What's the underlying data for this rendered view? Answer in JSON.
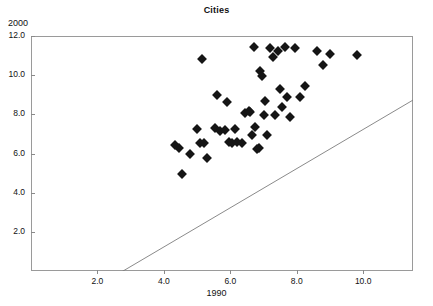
{
  "chart_data": {
    "type": "scatter",
    "title": "Cities",
    "xlabel": "1990",
    "ylabel": "2000",
    "xlim": [
      0,
      11.5
    ],
    "ylim": [
      0,
      12.0
    ],
    "grid": false,
    "legend": null,
    "xticks": [
      "2.0",
      "4.0",
      "6.0",
      "8.0",
      "10.0"
    ],
    "xtick_values": [
      2.0,
      4.0,
      6.0,
      8.0,
      10.0
    ],
    "yticks": [
      "2.0",
      "4.0",
      "6.0",
      "8.0",
      "10.0",
      "12.0"
    ],
    "ytick_values": [
      2.0,
      4.0,
      6.0,
      8.0,
      10.0,
      12.0
    ],
    "marker": "filled-diamond",
    "marker_color": "#151515",
    "reference_line": {
      "name": "y = x identity line",
      "x0": 0.0,
      "y0": 0.0,
      "x1": 11.5,
      "y1": 11.5,
      "color": "#7d7d7d"
    },
    "points": [
      {
        "x": 4.35,
        "y": 6.45
      },
      {
        "x": 4.45,
        "y": 6.3
      },
      {
        "x": 4.55,
        "y": 4.95
      },
      {
        "x": 4.8,
        "y": 6.0
      },
      {
        "x": 5.0,
        "y": 7.25
      },
      {
        "x": 5.1,
        "y": 6.55
      },
      {
        "x": 5.15,
        "y": 10.85
      },
      {
        "x": 5.2,
        "y": 6.55
      },
      {
        "x": 5.3,
        "y": 5.75
      },
      {
        "x": 5.55,
        "y": 7.3
      },
      {
        "x": 5.6,
        "y": 9.0
      },
      {
        "x": 5.7,
        "y": 7.15
      },
      {
        "x": 5.85,
        "y": 7.2
      },
      {
        "x": 5.9,
        "y": 8.65
      },
      {
        "x": 5.95,
        "y": 6.6
      },
      {
        "x": 6.05,
        "y": 6.55
      },
      {
        "x": 6.15,
        "y": 7.25
      },
      {
        "x": 6.2,
        "y": 6.6
      },
      {
        "x": 6.35,
        "y": 6.55
      },
      {
        "x": 6.45,
        "y": 8.05
      },
      {
        "x": 6.55,
        "y": 8.15
      },
      {
        "x": 6.6,
        "y": 8.1
      },
      {
        "x": 6.65,
        "y": 6.95
      },
      {
        "x": 6.7,
        "y": 11.45
      },
      {
        "x": 6.75,
        "y": 7.35
      },
      {
        "x": 6.8,
        "y": 6.25
      },
      {
        "x": 6.85,
        "y": 6.3
      },
      {
        "x": 6.9,
        "y": 10.2
      },
      {
        "x": 6.95,
        "y": 9.95
      },
      {
        "x": 7.0,
        "y": 7.95
      },
      {
        "x": 7.05,
        "y": 8.7
      },
      {
        "x": 7.1,
        "y": 6.95
      },
      {
        "x": 7.2,
        "y": 11.4
      },
      {
        "x": 7.3,
        "y": 10.95
      },
      {
        "x": 7.35,
        "y": 7.95
      },
      {
        "x": 7.45,
        "y": 11.25
      },
      {
        "x": 7.5,
        "y": 9.3
      },
      {
        "x": 7.55,
        "y": 8.35
      },
      {
        "x": 7.65,
        "y": 11.45
      },
      {
        "x": 7.7,
        "y": 8.9
      },
      {
        "x": 7.8,
        "y": 7.85
      },
      {
        "x": 7.95,
        "y": 11.4
      },
      {
        "x": 8.1,
        "y": 8.9
      },
      {
        "x": 8.25,
        "y": 9.45
      },
      {
        "x": 8.6,
        "y": 11.25
      },
      {
        "x": 8.8,
        "y": 10.5
      },
      {
        "x": 9.0,
        "y": 11.1
      },
      {
        "x": 9.8,
        "y": 11.05
      }
    ]
  }
}
